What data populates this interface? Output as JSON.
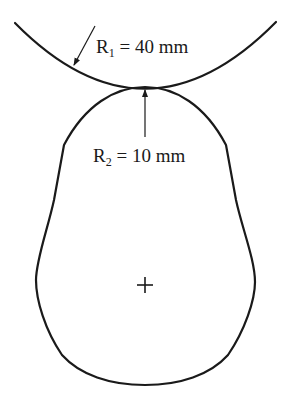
{
  "diagram": {
    "type": "contact-geometry",
    "upper_body": {
      "shape": "circular-arc",
      "label": {
        "symbol": "R",
        "subscript": "1",
        "text": " = 40 mm"
      }
    },
    "lower_body": {
      "shape": "cam-lobe",
      "label": {
        "symbol": "R",
        "subscript": "2",
        "text": " = 10 mm"
      }
    },
    "center_mark": "plus",
    "colors": {
      "line": "#1a1a1a",
      "background": "#ffffff"
    }
  }
}
